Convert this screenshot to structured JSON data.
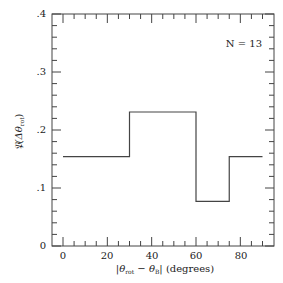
{
  "chart_data": {
    "type": "step-histogram",
    "title": "",
    "annotation": "N = 13",
    "xlabel": "|θ_rot − θ_B| (degrees)",
    "ylabel": "𝔓(Δθ_rot)",
    "xlim": [
      -5,
      95
    ],
    "ylim": [
      0,
      0.4
    ],
    "x_ticks": [
      0,
      20,
      40,
      60,
      80
    ],
    "x_tick_labels": [
      "0",
      "20",
      "40",
      "60",
      "80"
    ],
    "y_ticks": [
      0,
      0.1,
      0.2,
      0.3,
      0.4
    ],
    "y_tick_labels": [
      "0",
      ".1",
      ".2",
      ".3",
      ".4"
    ],
    "grid": false,
    "bins": [
      {
        "x0": 0,
        "x1": 30,
        "value": 0.154
      },
      {
        "x0": 30,
        "x1": 60,
        "value": 0.231
      },
      {
        "x0": 60,
        "x1": 75,
        "value": 0.077
      },
      {
        "x0": 75,
        "x1": 90,
        "value": 0.154
      }
    ],
    "line_color": "#444444"
  },
  "labels": {
    "annotation": "N = 13",
    "x_axis_main": "|θ",
    "x_axis_sub1": "rot",
    "x_axis_mid": " − θ",
    "x_axis_sub2": "B",
    "x_axis_end": "| (degrees)",
    "y_axis_main": "𝔓(Δθ",
    "y_axis_sub": "rot",
    "y_axis_end": ")",
    "x_ticks": [
      "0",
      "20",
      "40",
      "60",
      "80"
    ],
    "y_ticks": [
      "0",
      ".1",
      ".2",
      ".3",
      ".4"
    ]
  }
}
